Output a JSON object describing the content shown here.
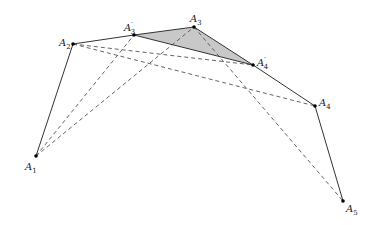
{
  "diagram": {
    "points": [
      {
        "id": "A1",
        "label": "A",
        "sub": "1",
        "prime": "",
        "x": 36,
        "y": 156,
        "lx": 25,
        "ly": 170
      },
      {
        "id": "A2",
        "label": "A",
        "sub": "2",
        "prime": "",
        "x": 73,
        "y": 44,
        "lx": 59,
        "ly": 46
      },
      {
        "id": "A3p",
        "label": "A",
        "sub": "3",
        "prime": "′",
        "x": 134,
        "y": 35,
        "lx": 124,
        "ly": 31
      },
      {
        "id": "A3",
        "label": "A",
        "sub": "3",
        "prime": "",
        "x": 194,
        "y": 27,
        "lx": 190,
        "ly": 22
      },
      {
        "id": "A4p",
        "label": "A",
        "sub": "4",
        "prime": "′",
        "x": 253,
        "y": 65,
        "lx": 257,
        "ly": 66
      },
      {
        "id": "A4",
        "label": "A",
        "sub": "4",
        "prime": "",
        "x": 315,
        "y": 106,
        "lx": 319,
        "ly": 106
      },
      {
        "id": "A5",
        "label": "A",
        "sub": "5",
        "prime": "",
        "x": 343,
        "y": 201,
        "lx": 346,
        "ly": 212
      }
    ],
    "solid_edges": [
      [
        "A1",
        "A2"
      ],
      [
        "A2",
        "A3p"
      ],
      [
        "A3p",
        "A3"
      ],
      [
        "A3",
        "A4p"
      ],
      [
        "A3p",
        "A4p"
      ],
      [
        "A4p",
        "A4"
      ],
      [
        "A4",
        "A5"
      ]
    ],
    "dashed_edges": [
      [
        "A1",
        "A3p"
      ],
      [
        "A1",
        "A3"
      ],
      [
        "A2",
        "A4p"
      ],
      [
        "A2",
        "A4"
      ],
      [
        "A3",
        "A5"
      ]
    ],
    "shaded_triangle": [
      "A3p",
      "A3",
      "A4p"
    ],
    "colors": {
      "line": "#333333",
      "fill": "#c8c8c8"
    }
  }
}
